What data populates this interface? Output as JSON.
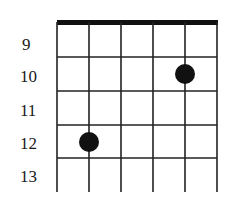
{
  "diagram": {
    "type": "guitar-fretboard-diagram",
    "strings": 6,
    "fret_labels": [
      "9",
      "10",
      "11",
      "12",
      "13"
    ],
    "dots": [
      {
        "string": 5,
        "fret": "10"
      },
      {
        "string": 2,
        "fret": "12"
      }
    ],
    "colors": {
      "line": "#1a1a1a",
      "dot": "#111111",
      "background": "#ffffff"
    }
  }
}
